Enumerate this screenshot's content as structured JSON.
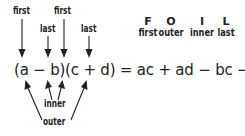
{
  "diagram": {
    "top_labels": [
      {
        "text": "first",
        "target": "a"
      },
      {
        "text": "last",
        "target": "b"
      },
      {
        "text": "first",
        "target": "c"
      },
      {
        "text": "last",
        "target": "d"
      }
    ],
    "equation": "(a − b)(c + d) = ac + ad − bc − bd",
    "bottom_labels": [
      {
        "text": "inner",
        "targets": [
          "b",
          "c"
        ]
      },
      {
        "text": "outer",
        "targets": [
          "a",
          "d"
        ]
      }
    ],
    "foil_legend": [
      {
        "letter": "F",
        "word": "first"
      },
      {
        "letter": "O",
        "word": "outer"
      },
      {
        "letter": "I",
        "word": "inner"
      },
      {
        "letter": "L",
        "word": "last"
      }
    ],
    "colors": {
      "ink": "#222222",
      "background": "#ffffff"
    }
  }
}
